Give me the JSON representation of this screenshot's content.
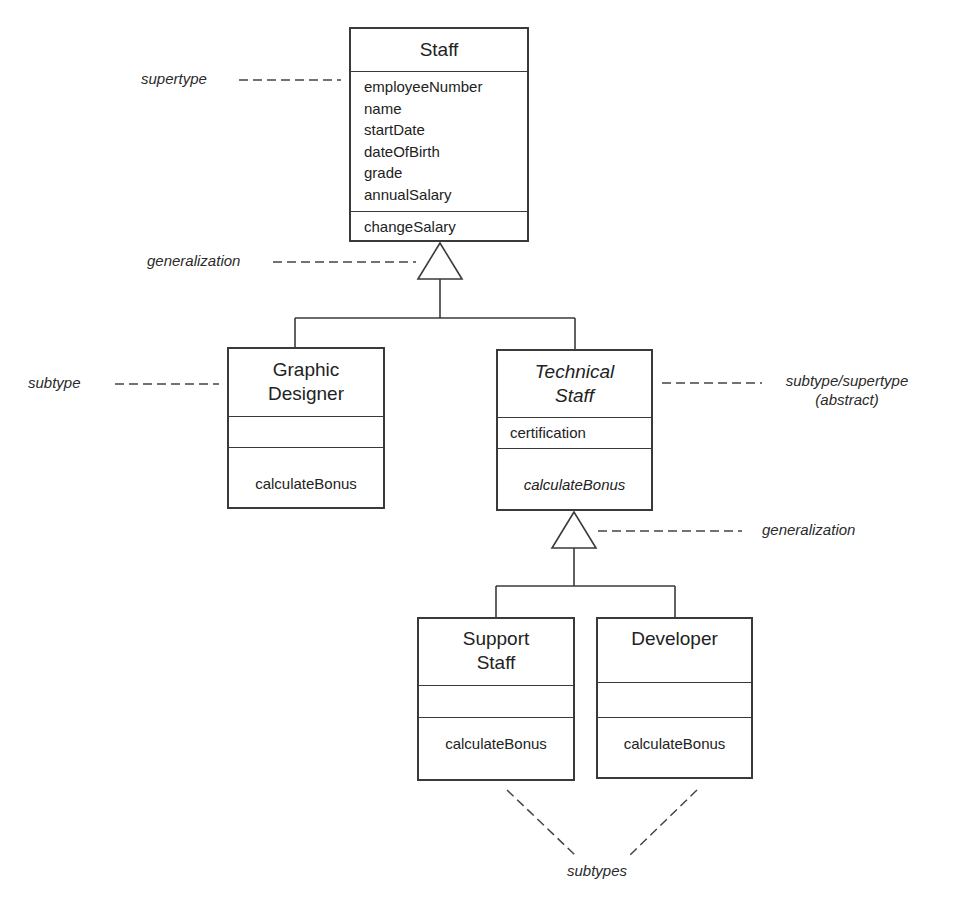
{
  "diagram": {
    "type": "UML class generalization hierarchy",
    "colors": {
      "line": "#3a3a3a",
      "text": "#222222",
      "background": "#ffffff"
    }
  },
  "classes": {
    "staff": {
      "name": "Staff",
      "attributes": [
        "employeeNumber",
        "name",
        "startDate",
        "dateOfBirth",
        "grade",
        "annualSalary"
      ],
      "operations": [
        "changeSalary"
      ]
    },
    "graphic_designer": {
      "name_line1": "Graphic",
      "name_line2": "Designer",
      "attributes": [],
      "operations": [
        "calculateBonus"
      ]
    },
    "technical_staff": {
      "name_line1": "Technical",
      "name_line2": "Staff",
      "abstract": true,
      "attributes": [
        "certification"
      ],
      "operations": [
        "calculateBonus"
      ]
    },
    "support_staff": {
      "name_line1": "Support",
      "name_line2": "Staff",
      "attributes": [],
      "operations": [
        "calculateBonus"
      ]
    },
    "developer": {
      "name": "Developer",
      "attributes": [],
      "operations": [
        "calculateBonus"
      ]
    }
  },
  "annotations": {
    "supertype": "supertype",
    "generalization_top": "generalization",
    "subtype": "subtype",
    "subtype_supertype_line1": "subtype/supertype",
    "subtype_supertype_line2": "(abstract)",
    "generalization_bottom": "generalization",
    "subtypes": "subtypes"
  }
}
